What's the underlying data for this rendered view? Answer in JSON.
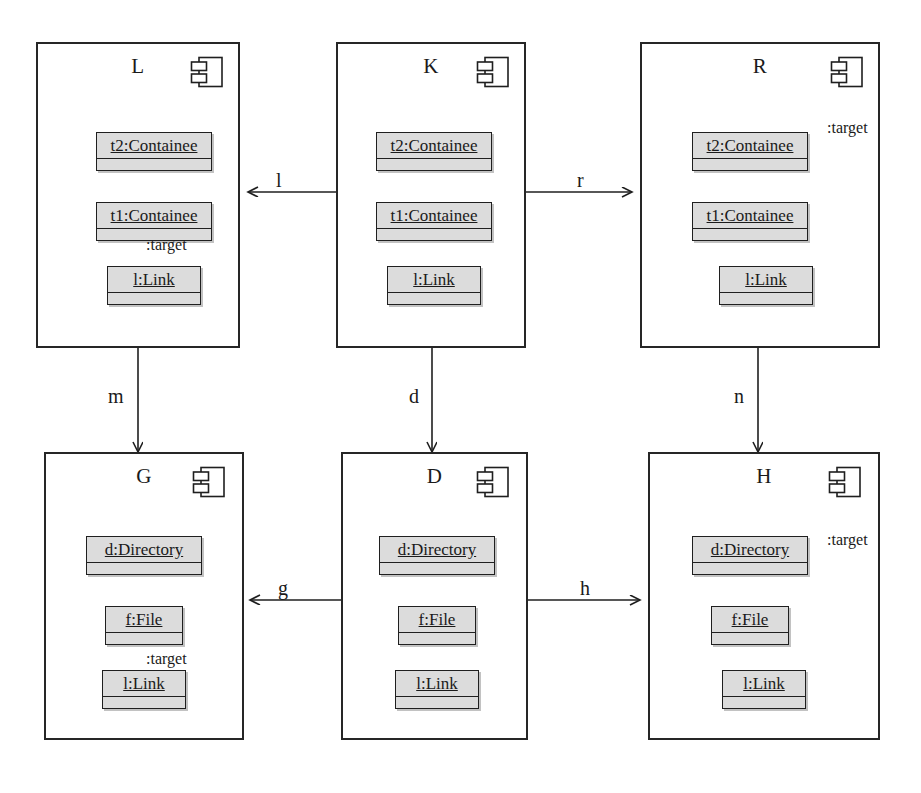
{
  "diagram": {
    "stroke_color": "#262626",
    "object_fill": "#dcdcdc",
    "background": "#ffffff"
  },
  "components": [
    {
      "id": "L",
      "name": "L",
      "icon": "component-icon",
      "objects": [
        {
          "label": "t2:Containee"
        },
        {
          "label": "t1:Containee"
        },
        {
          "label": "l:Link"
        }
      ],
      "internal_link": {
        "label": ":target",
        "from": "l:Link",
        "to": "t1:Containee",
        "style": "vertical"
      }
    },
    {
      "id": "K",
      "name": "K",
      "icon": "component-icon",
      "objects": [
        {
          "label": "t2:Containee"
        },
        {
          "label": "t1:Containee"
        },
        {
          "label": "l:Link"
        }
      ],
      "internal_link": null
    },
    {
      "id": "R",
      "name": "R",
      "icon": "component-icon",
      "objects": [
        {
          "label": "t2:Containee"
        },
        {
          "label": "t1:Containee"
        },
        {
          "label": "l:Link"
        }
      ],
      "internal_link": {
        "label": ":target",
        "from": "l:Link",
        "to": "t2:Containee",
        "style": "routed-right"
      }
    },
    {
      "id": "G",
      "name": "G",
      "icon": "component-icon",
      "objects": [
        {
          "label": "d:Directory"
        },
        {
          "label": "f:File"
        },
        {
          "label": "l:Link"
        }
      ],
      "internal_link": {
        "label": ":target",
        "from": "l:Link",
        "to": "f:File",
        "style": "vertical"
      }
    },
    {
      "id": "D",
      "name": "D",
      "icon": "component-icon",
      "objects": [
        {
          "label": "d:Directory"
        },
        {
          "label": "f:File"
        },
        {
          "label": "l:Link"
        }
      ],
      "internal_link": null
    },
    {
      "id": "H",
      "name": "H",
      "icon": "component-icon",
      "objects": [
        {
          "label": "d:Directory"
        },
        {
          "label": "f:File"
        },
        {
          "label": "l:Link"
        }
      ],
      "internal_link": {
        "label": ":target",
        "from": "l:Link",
        "to": "d:Directory",
        "style": "routed-right"
      }
    }
  ],
  "edges": [
    {
      "id": "l",
      "label": "l",
      "from": "K",
      "to": "L",
      "direction": "left"
    },
    {
      "id": "r",
      "label": "r",
      "from": "K",
      "to": "R",
      "direction": "right"
    },
    {
      "id": "m",
      "label": "m",
      "from": "L",
      "to": "G",
      "direction": "down"
    },
    {
      "id": "d",
      "label": "d",
      "from": "K",
      "to": "D",
      "direction": "down"
    },
    {
      "id": "n",
      "label": "n",
      "from": "R",
      "to": "H",
      "direction": "down"
    },
    {
      "id": "g",
      "label": "g",
      "from": "D",
      "to": "G",
      "direction": "left"
    },
    {
      "id": "h",
      "label": "h",
      "from": "D",
      "to": "H",
      "direction": "right"
    }
  ],
  "target_labels": {
    "L": ":target",
    "R": ":target",
    "G": ":target",
    "H": ":target"
  }
}
